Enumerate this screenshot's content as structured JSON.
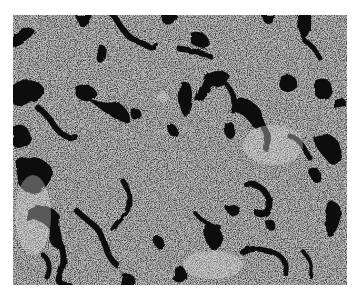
{
  "image": {
    "kind": "grayscale micrograph",
    "description": "Histology-style tissue section with speckled gray cellular texture and dark irregular channel-like regions",
    "colors": {
      "background_page": "#ffffff",
      "tissue_base": "#a9a9a9",
      "speckle_dark": "#3a3a3a",
      "speckle_light": "#d8d8d8",
      "channels": "#111111"
    }
  }
}
